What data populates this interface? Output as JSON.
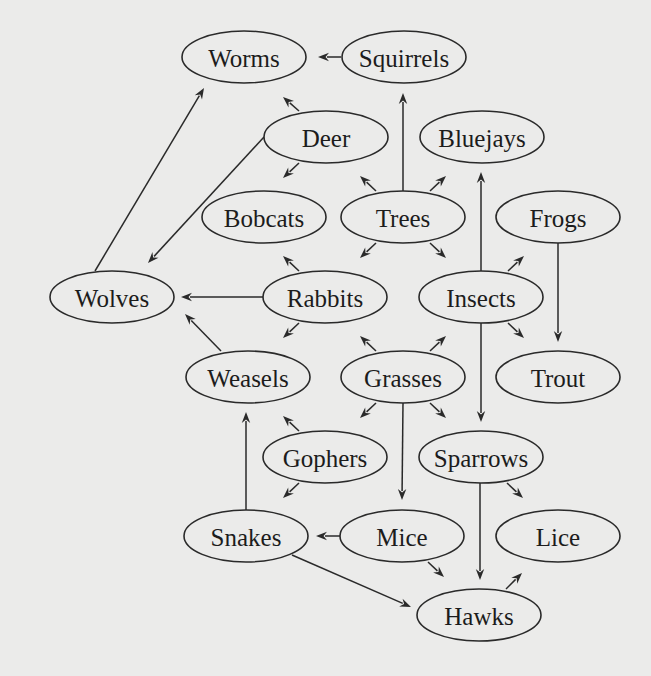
{
  "diagram": {
    "background": "#ebebea",
    "stroke_color": "#2a2a2a",
    "text_color": "#1c1c1c",
    "node_rx": 62,
    "node_ry": 26,
    "nodes": [
      {
        "id": "worms",
        "label": "Worms",
        "cx": 244,
        "cy": 57
      },
      {
        "id": "squirrels",
        "label": "Squirrels",
        "cx": 404,
        "cy": 57
      },
      {
        "id": "deer",
        "label": "Deer",
        "cx": 326,
        "cy": 137
      },
      {
        "id": "bluejays",
        "label": "Bluejays",
        "cx": 482,
        "cy": 137
      },
      {
        "id": "bobcats",
        "label": "Bobcats",
        "cx": 264,
        "cy": 217
      },
      {
        "id": "trees",
        "label": "Trees",
        "cx": 403,
        "cy": 217
      },
      {
        "id": "frogs",
        "label": "Frogs",
        "cx": 558,
        "cy": 217
      },
      {
        "id": "wolves",
        "label": "Wolves",
        "cx": 112,
        "cy": 297
      },
      {
        "id": "rabbits",
        "label": "Rabbits",
        "cx": 325,
        "cy": 297
      },
      {
        "id": "insects",
        "label": "Insects",
        "cx": 481,
        "cy": 297
      },
      {
        "id": "weasels",
        "label": "Weasels",
        "cx": 248,
        "cy": 377
      },
      {
        "id": "grasses",
        "label": "Grasses",
        "cx": 403,
        "cy": 377
      },
      {
        "id": "trout",
        "label": "Trout",
        "cx": 558,
        "cy": 377
      },
      {
        "id": "gophers",
        "label": "Gophers",
        "cx": 325,
        "cy": 457
      },
      {
        "id": "sparrows",
        "label": "Sparrows",
        "cx": 481,
        "cy": 457
      },
      {
        "id": "snakes",
        "label": "Snakes",
        "cx": 246,
        "cy": 536
      },
      {
        "id": "mice",
        "label": "Mice",
        "cx": 402,
        "cy": 536
      },
      {
        "id": "lice",
        "label": "Lice",
        "cx": 558,
        "cy": 536
      },
      {
        "id": "hawks",
        "label": "Hawks",
        "cx": 479,
        "cy": 615
      }
    ],
    "edges": [
      {
        "from": "squirrels",
        "to": "worms",
        "x1": 341,
        "y1": 57,
        "x2": 318,
        "y2": 57
      },
      {
        "from": "deer",
        "to": "worms",
        "x1": 299,
        "y1": 111,
        "x2": 283,
        "y2": 97
      },
      {
        "from": "deer",
        "to": "bobcats",
        "x1": 299,
        "y1": 163,
        "x2": 283,
        "y2": 178
      },
      {
        "from": "deer",
        "to": "wolves",
        "x1": 264,
        "y1": 137,
        "x2": 148,
        "y2": 263
      },
      {
        "from": "wolves",
        "to": "worms",
        "x1": 95,
        "y1": 271,
        "x2": 204,
        "y2": 88
      },
      {
        "from": "trees",
        "to": "squirrels",
        "x1": 403,
        "y1": 191,
        "x2": 403,
        "y2": 93
      },
      {
        "from": "trees",
        "to": "deer",
        "x1": 376,
        "y1": 191,
        "x2": 360,
        "y2": 176
      },
      {
        "from": "trees",
        "to": "bluejays",
        "x1": 430,
        "y1": 191,
        "x2": 446,
        "y2": 176
      },
      {
        "from": "trees",
        "to": "rabbits",
        "x1": 376,
        "y1": 243,
        "x2": 360,
        "y2": 258
      },
      {
        "from": "trees",
        "to": "insects",
        "x1": 430,
        "y1": 243,
        "x2": 446,
        "y2": 258
      },
      {
        "from": "rabbits",
        "to": "bobcats",
        "x1": 299,
        "y1": 271,
        "x2": 283,
        "y2": 256
      },
      {
        "from": "rabbits",
        "to": "wolves",
        "x1": 263,
        "y1": 297,
        "x2": 181,
        "y2": 297
      },
      {
        "from": "rabbits",
        "to": "weasels",
        "x1": 299,
        "y1": 323,
        "x2": 283,
        "y2": 338
      },
      {
        "from": "weasels",
        "to": "wolves",
        "x1": 221,
        "y1": 351,
        "x2": 185,
        "y2": 314
      },
      {
        "from": "insects",
        "to": "bluejays",
        "x1": 481,
        "y1": 271,
        "x2": 481,
        "y2": 172
      },
      {
        "from": "insects",
        "to": "frogs",
        "x1": 508,
        "y1": 271,
        "x2": 524,
        "y2": 256
      },
      {
        "from": "insects",
        "to": "trout",
        "x1": 508,
        "y1": 323,
        "x2": 524,
        "y2": 338
      },
      {
        "from": "insects",
        "to": "sparrows",
        "x1": 481,
        "y1": 323,
        "x2": 481,
        "y2": 422
      },
      {
        "from": "frogs",
        "to": "trout",
        "x1": 558,
        "y1": 243,
        "x2": 558,
        "y2": 342
      },
      {
        "from": "grasses",
        "to": "rabbits",
        "x1": 376,
        "y1": 351,
        "x2": 360,
        "y2": 336
      },
      {
        "from": "grasses",
        "to": "insects",
        "x1": 430,
        "y1": 351,
        "x2": 446,
        "y2": 336
      },
      {
        "from": "grasses",
        "to": "gophers",
        "x1": 376,
        "y1": 403,
        "x2": 360,
        "y2": 418
      },
      {
        "from": "grasses",
        "to": "sparrows",
        "x1": 430,
        "y1": 403,
        "x2": 446,
        "y2": 418
      },
      {
        "from": "grasses",
        "to": "mice",
        "x1": 403,
        "y1": 403,
        "x2": 402,
        "y2": 500
      },
      {
        "from": "gophers",
        "to": "weasels",
        "x1": 299,
        "y1": 431,
        "x2": 283,
        "y2": 416
      },
      {
        "from": "gophers",
        "to": "snakes",
        "x1": 299,
        "y1": 483,
        "x2": 283,
        "y2": 498
      },
      {
        "from": "snakes",
        "to": "weasels",
        "x1": 246,
        "y1": 510,
        "x2": 246,
        "y2": 412
      },
      {
        "from": "mice",
        "to": "snakes",
        "x1": 340,
        "y1": 536,
        "x2": 316,
        "y2": 536
      },
      {
        "from": "mice",
        "to": "hawks",
        "x1": 428,
        "y1": 562,
        "x2": 444,
        "y2": 577
      },
      {
        "from": "snakes",
        "to": "hawks",
        "x1": 292,
        "y1": 555,
        "x2": 411,
        "y2": 607
      },
      {
        "from": "sparrows",
        "to": "hawks",
        "x1": 480,
        "y1": 483,
        "x2": 480,
        "y2": 580
      },
      {
        "from": "sparrows",
        "to": "lice",
        "x1": 507,
        "y1": 483,
        "x2": 523,
        "y2": 498
      },
      {
        "from": "hawks",
        "to": "lice",
        "x1": 506,
        "y1": 589,
        "x2": 522,
        "y2": 573
      }
    ]
  }
}
